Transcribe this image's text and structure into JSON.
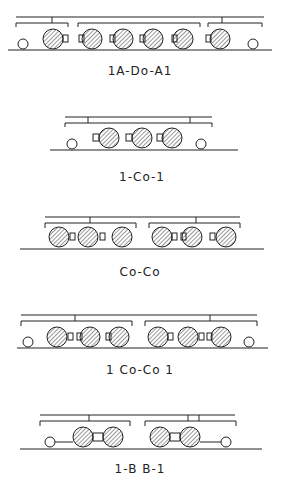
{
  "diagrams": [
    {
      "label": "1A-Do-A1",
      "y": 0
    },
    {
      "label": "1-Co-1",
      "y": 100
    },
    {
      "label": "Co-Co",
      "y": 200
    },
    {
      "label": "1 Co-Co 1",
      "y": 300
    },
    {
      "label": "1-B B-1",
      "y": 390
    }
  ],
  "colors": {
    "ink": "#222222",
    "background": "#ffffff"
  }
}
